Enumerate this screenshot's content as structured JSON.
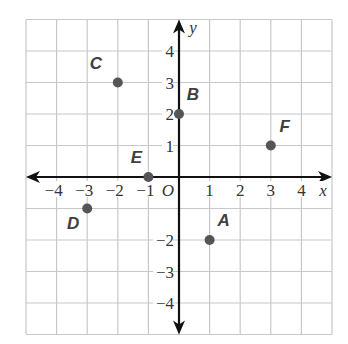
{
  "chart_data": {
    "type": "scatter",
    "title": "",
    "xlabel": "x",
    "ylabel": "y",
    "origin_label": "O",
    "xlim": [
      -5,
      5
    ],
    "ylim": [
      -5,
      5
    ],
    "grid": true,
    "x_ticks": [
      -4,
      -3,
      -2,
      -1,
      1,
      2,
      3,
      4
    ],
    "y_ticks": [
      4,
      3,
      2,
      1,
      -2,
      -3,
      -4
    ],
    "x_tick_labels": [
      "−4",
      "−3",
      "−2",
      "−1",
      "1",
      "2",
      "3",
      "4"
    ],
    "y_tick_labels": [
      "4",
      "3",
      "2",
      "1",
      "−2",
      "−3",
      "−4"
    ],
    "points": [
      {
        "label": "A",
        "x": 1,
        "y": -2
      },
      {
        "label": "B",
        "x": 0,
        "y": 2
      },
      {
        "label": "C",
        "x": -2,
        "y": 3
      },
      {
        "label": "D",
        "x": -3,
        "y": -1
      },
      {
        "label": "E",
        "x": -1,
        "y": 0
      },
      {
        "label": "F",
        "x": 3,
        "y": 1
      }
    ]
  },
  "colors": {
    "grid": "#c8c8c8",
    "axis": "#111111",
    "point": "#555555",
    "text": "#333333"
  }
}
